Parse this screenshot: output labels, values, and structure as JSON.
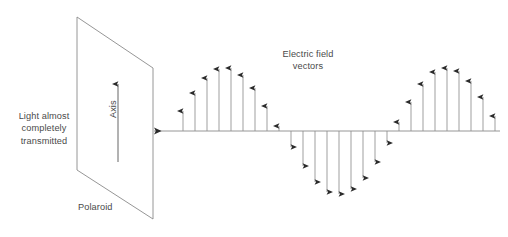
{
  "diagram": {
    "background_color": "#ffffff",
    "stroke_color": "#777777",
    "text_color": "#4a4a4a",
    "width": 508,
    "height": 237
  },
  "labels": {
    "transmitted": "Light almost\ncompletely\ntransmitted",
    "polaroid": "Polaroid",
    "axis": "Axis",
    "electric_field": "Electric field\nvectors"
  },
  "polaroid": {
    "name": "polaroid-sheet",
    "corners": [
      [
        77,
        17
      ],
      [
        153,
        68
      ],
      [
        153,
        219
      ],
      [
        77,
        170
      ]
    ],
    "axis_arrow": {
      "x": 118,
      "y_bottom": 162,
      "y_top": 84,
      "direction": "up"
    }
  },
  "propagation_axis": {
    "name": "propagation-axis",
    "y": 131,
    "x_start": 500,
    "x_end": 152,
    "arrow_direction": "left"
  },
  "chart_data": {
    "type": "line",
    "title": "Electric field vectors",
    "xlabel": "",
    "ylabel": "",
    "baseline_y": 131,
    "amplitude_px": 63,
    "wavelength_px": 150,
    "arrow_spacing_px": 12,
    "x_first": 183,
    "x_last": 495,
    "phase_offset_px": 0,
    "arrow_x": [
      183,
      195,
      207,
      219,
      231,
      243,
      255,
      267,
      279,
      291,
      303,
      315,
      327,
      339,
      351,
      363,
      375,
      387,
      399,
      411,
      423,
      435,
      447,
      459,
      471,
      483,
      495
    ],
    "arrow_amplitude": [
      20,
      38,
      53,
      62,
      63,
      56,
      43,
      25,
      5,
      -16,
      -35,
      -51,
      -61,
      -63,
      -58,
      -47,
      -31,
      -12,
      9,
      29,
      47,
      59,
      63,
      60,
      50,
      34,
      15
    ]
  }
}
